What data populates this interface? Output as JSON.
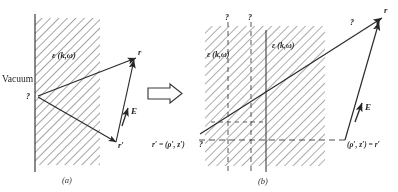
{
  "figure": {
    "type": "physics-diagram",
    "panels": [
      {
        "id": "a",
        "caption": "(a)",
        "labels": {
          "vacuum": "Vacuum",
          "dielectric": "ε (k,ω)",
          "origin_point": "?",
          "field_point": "r",
          "source_point": "r′",
          "field_vector": "E"
        }
      },
      {
        "id": "b",
        "caption": "(b)",
        "labels": {
          "dielectric_left": "ε (k,ω)",
          "dielectric_right": "ε (k,ω)",
          "top_marker_1": "?",
          "top_marker_2": "?",
          "ray_marker": "?",
          "origin_marker": "?",
          "field_point": "r",
          "field_vector": "E",
          "source_coords": "(ρ′, z′) = r′",
          "source_definition": "r′ = (ρ′, z′)"
        }
      }
    ],
    "transform_arrow": "⇒",
    "colors": {
      "ink": "#262626",
      "hatch": "#555555",
      "dashed": "#3a3a3a",
      "paper": "#ffffff"
    }
  }
}
